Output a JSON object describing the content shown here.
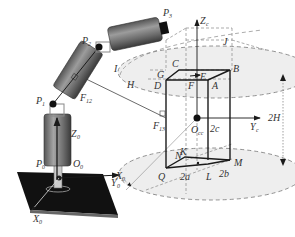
{
  "labels": {
    "P0": {
      "base": "P",
      "sub": "0"
    },
    "P1": {
      "base": "P",
      "sub": "1"
    },
    "P2": {
      "base": "P",
      "sub": "2"
    },
    "P3": {
      "base": "P",
      "sub": "3"
    },
    "Z0": {
      "base": "Z",
      "sub": "0"
    },
    "O0": {
      "base": "O",
      "sub": "0"
    },
    "X0": {
      "base": "X",
      "sub": "0"
    },
    "Y0": {
      "base": "Y",
      "sub": "0"
    },
    "X0b": {
      "base": "X",
      "sub": "0"
    },
    "F12": {
      "base": "F",
      "sub": "12"
    },
    "F13": {
      "base": "F",
      "sub": "13"
    },
    "Zc": {
      "base": "Z",
      "sub": "c"
    },
    "Yc": {
      "base": "Y",
      "sub": "c"
    },
    "Occ": {
      "base": "O",
      "sub": "cc"
    },
    "A": "A",
    "B": "B",
    "C": "C",
    "D": "D",
    "E": "E",
    "F": "F",
    "G": "G",
    "H": "H",
    "I": "I",
    "J": "J",
    "K": "K",
    "L": "L",
    "M": "M",
    "N": "N",
    "Q": "Q",
    "dim_2a": "2a",
    "dim_2b": "2b",
    "dim_2c": "2c",
    "dim_2H": "2H"
  },
  "colors": {
    "ink": "#1a1a1a",
    "dashed": "#777777",
    "ellipse_fill": "#eeeeee",
    "cylinder_dark": "#4a4a4a",
    "cylinder_light": "#9a9a9a",
    "base_plate": "#111111"
  }
}
